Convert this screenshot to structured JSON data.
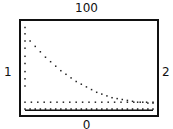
{
  "labels": {
    "top": "100",
    "bottom": "0",
    "left": "1",
    "right": "2"
  },
  "chart_data": {
    "type": "scatter",
    "title": "",
    "xlabel": "",
    "ylabel": "",
    "xlim": [
      1,
      2
    ],
    "ylim": [
      0,
      100
    ],
    "grid": false,
    "legend": "none",
    "series": [
      {
        "name": "decay",
        "style": "dotted",
        "x": [
          1.0,
          1.0,
          1.0,
          1.0,
          1.0,
          1.0,
          1.0,
          1.0,
          1.0,
          1.04,
          1.08,
          1.12,
          1.16,
          1.2,
          1.24,
          1.28,
          1.32,
          1.36,
          1.4,
          1.44,
          1.48,
          1.52,
          1.56,
          1.6,
          1.64,
          1.68,
          1.72,
          1.76,
          1.8,
          1.84,
          1.88,
          1.92,
          1.96,
          2.0
        ],
        "y": [
          95,
          88,
          80,
          72,
          63,
          55,
          46,
          38,
          30,
          80,
          74,
          68,
          62,
          57,
          52,
          47,
          43,
          39,
          35,
          32,
          29,
          26,
          23,
          21,
          19,
          17,
          16,
          15,
          14,
          13,
          12,
          12,
          11,
          11
        ]
      },
      {
        "name": "plateau",
        "style": "dotted",
        "x": [
          1.0,
          1.05,
          1.1,
          1.15,
          1.2,
          1.25,
          1.3,
          1.35,
          1.4,
          1.45,
          1.5,
          1.55,
          1.6,
          1.65,
          1.7,
          1.75,
          1.8,
          1.85,
          1.9,
          1.95,
          2.0
        ],
        "y": [
          12,
          12,
          12,
          12,
          12,
          12,
          12,
          12,
          12,
          12,
          12,
          12,
          12,
          12,
          12,
          12,
          12,
          12,
          12,
          12,
          12
        ]
      },
      {
        "name": "baseline",
        "style": "solid-dotted",
        "x": [
          1.0,
          2.0
        ],
        "y": [
          3,
          3
        ]
      }
    ]
  }
}
